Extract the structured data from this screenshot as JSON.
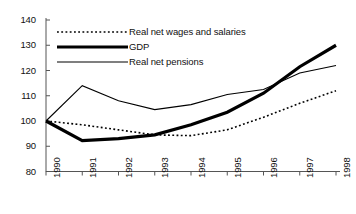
{
  "chart_data": {
    "type": "line",
    "title": "",
    "subtitle": "",
    "xlabel": "",
    "ylabel": "",
    "grid": false,
    "legend_position": "top-left-inside",
    "x": [
      "1990",
      "1991",
      "1992",
      "1993",
      "1994",
      "1995",
      "1996",
      "1997",
      "1998"
    ],
    "categories": [
      "1990",
      "1991",
      "1992",
      "1993",
      "1994",
      "1995",
      "1996",
      "1997",
      "1998"
    ],
    "xlim": [
      "1990",
      "1998"
    ],
    "ylim": [
      80,
      140
    ],
    "ytick_step": 10,
    "yticks": [
      80,
      90,
      100,
      110,
      120,
      130,
      140
    ],
    "series": [
      {
        "name": "Real net wages and salaries",
        "style": "dotted",
        "color": "#000000",
        "width": 1.6,
        "values": [
          100,
          98.5,
          96.5,
          94.5,
          94.2,
          96.5,
          101.5,
          107,
          112
        ]
      },
      {
        "name": "GDP",
        "style": "thick-solid",
        "color": "#000000",
        "width": 3.2,
        "values": [
          100,
          92.2,
          93,
          94.5,
          98.5,
          103.5,
          111,
          121.5,
          130
        ]
      },
      {
        "name": "Real net pensions",
        "style": "thin-solid",
        "color": "#000000",
        "width": 1.1,
        "values": [
          100,
          114,
          108,
          104.5,
          106.5,
          110.5,
          112.5,
          119,
          122
        ]
      }
    ]
  },
  "axes": {
    "y_tick_labels": [
      "140",
      "130",
      "120",
      "110",
      "100",
      "90",
      "80"
    ],
    "x_tick_labels": [
      "1990",
      "1991",
      "1992",
      "1993",
      "1994",
      "1995",
      "1996",
      "1997",
      "1998"
    ]
  },
  "legend": {
    "entries": [
      {
        "label": "Real net wages and salaries",
        "style": "dotted"
      },
      {
        "label": "GDP",
        "style": "thick-solid"
      },
      {
        "label": "Real net pensions",
        "style": "thin-solid"
      }
    ]
  }
}
